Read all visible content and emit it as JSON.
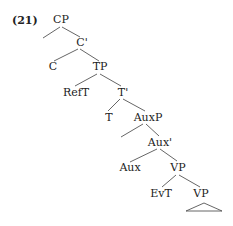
{
  "example_number": "(21)",
  "nodes": {
    "cp": "CP",
    "c_bar": "C'",
    "c": "C",
    "tp": "TP",
    "reft": "RefT",
    "t_bar": "T'",
    "t": "T",
    "auxp": "AuxP",
    "aux_bar": "Aux'",
    "aux": "Aux",
    "vp1": "VP",
    "evt": "EvT",
    "vp2": "VP"
  },
  "edges": [
    [
      "CP",
      "(empty spec)"
    ],
    [
      "CP",
      "C'"
    ],
    [
      "C'",
      "C"
    ],
    [
      "C'",
      "TP"
    ],
    [
      "TP",
      "RefT"
    ],
    [
      "TP",
      "T'"
    ],
    [
      "T'",
      "T"
    ],
    [
      "T'",
      "AuxP"
    ],
    [
      "AuxP",
      "(empty spec)"
    ],
    [
      "AuxP",
      "Aux'"
    ],
    [
      "Aux'",
      "Aux"
    ],
    [
      "Aux'",
      "VP"
    ],
    [
      "VP",
      "EvT"
    ],
    [
      "VP",
      "VP"
    ],
    [
      "VP",
      "triangle"
    ]
  ]
}
